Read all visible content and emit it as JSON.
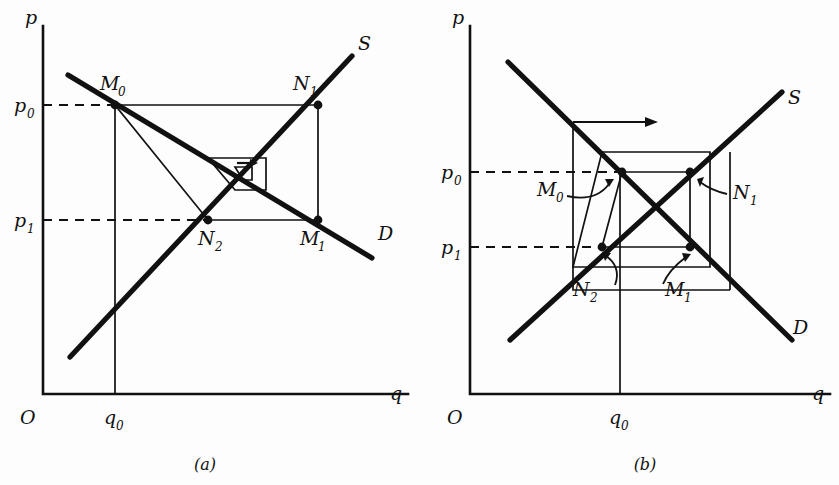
{
  "figure": {
    "type": "economics-cobweb-diagram",
    "ink_color": "#111111",
    "background_color": "#fdfdfd"
  },
  "panel_a": {
    "caption": "(a)",
    "axis": {
      "origin_label": "O",
      "x_label": "q",
      "y_label": "p"
    },
    "ticks": {
      "p0": "p",
      "p0_sub": "0",
      "p1": "p",
      "p1_sub": "1",
      "q0": "q",
      "q0_sub": "0"
    },
    "curves": [
      {
        "name": "supply",
        "label": "S"
      },
      {
        "name": "demand",
        "label": "D"
      }
    ],
    "points": [
      {
        "label": "M",
        "sub": "0",
        "x": 115,
        "y": 105
      },
      {
        "label": "N",
        "sub": "1",
        "x": 318,
        "y": 105
      },
      {
        "label": "N",
        "sub": "2",
        "x": 208,
        "y": 220
      },
      {
        "label": "M",
        "sub": "1",
        "x": 318,
        "y": 220
      }
    ],
    "convergence": "converging-inward-spiral"
  },
  "panel_b": {
    "caption": "(b)",
    "axis": {
      "origin_label": "O",
      "x_label": "q",
      "y_label": "p"
    },
    "ticks": {
      "p0": "p",
      "p0_sub": "0",
      "p1": "p",
      "p1_sub": "1",
      "q0": "q",
      "q0_sub": "0"
    },
    "curves": [
      {
        "name": "supply",
        "label": "S"
      },
      {
        "name": "demand",
        "label": "D"
      }
    ],
    "points": [
      {
        "label": "M",
        "sub": "0",
        "x": 622,
        "y": 172
      },
      {
        "label": "N",
        "sub": "1",
        "x": 690,
        "y": 172
      },
      {
        "label": "N",
        "sub": "2",
        "x": 602,
        "y": 247
      },
      {
        "label": "M",
        "sub": "1",
        "x": 690,
        "y": 247
      }
    ],
    "convergence": "diverging-outward-spiral",
    "divergence_arrow": "rightward-arrow"
  }
}
